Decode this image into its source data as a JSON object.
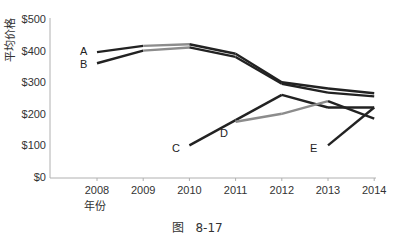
{
  "chart_data": {
    "type": "line",
    "title": "",
    "xlabel": "年份",
    "ylabel": "平均价格",
    "caption": "图   8-17",
    "categories": [
      "2008",
      "2009",
      "2010",
      "2011",
      "2012",
      "2013",
      "2014"
    ],
    "yticks": [
      "$0",
      "$100",
      "$200",
      "$300",
      "$400",
      "$500"
    ],
    "ylim": [
      0,
      500
    ],
    "grid": false,
    "legend": "inline labels",
    "series": [
      {
        "name": "A",
        "values": [
          395,
          415,
          420,
          390,
          300,
          280,
          265
        ],
        "gray_segments": [
          [
            1,
            2
          ]
        ]
      },
      {
        "name": "B",
        "values": [
          360,
          400,
          410,
          380,
          295,
          267,
          255
        ],
        "gray_segments": [
          [
            1,
            2
          ]
        ]
      },
      {
        "name": "C",
        "values": [
          null,
          null,
          100,
          180,
          260,
          220,
          220
        ],
        "gray_segments": []
      },
      {
        "name": "D",
        "values": [
          null,
          null,
          null,
          175,
          200,
          240,
          185
        ],
        "gray_segments": [
          [
            3,
            5
          ]
        ]
      },
      {
        "name": "E",
        "values": [
          null,
          null,
          null,
          null,
          null,
          100,
          220
        ],
        "gray_segments": []
      }
    ],
    "colors": {
      "dark": "#222222",
      "gray": "#8c8c8c",
      "axis": "#b0b0b0"
    }
  }
}
